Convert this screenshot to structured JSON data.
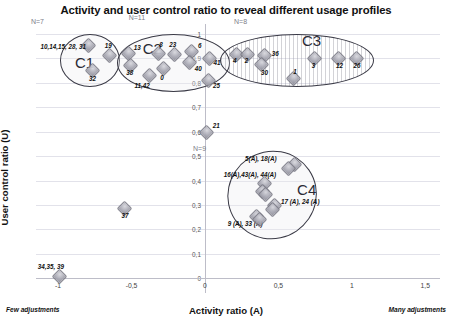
{
  "chart_data": {
    "type": "scatter",
    "title": "Activity and user control ratio to reveal different usage profiles",
    "xlabel": "Activity ratio (A)",
    "ylabel": "User control ratio (U)",
    "xlim": [
      -1.15,
      1.6
    ],
    "ylim": [
      -0.06,
      1.04
    ],
    "grid": true,
    "legend": "none",
    "xticks": [
      "-1",
      "-0,5",
      "0",
      "0,5",
      "1",
      "1,5"
    ],
    "xtick_values": [
      -1,
      -0.5,
      0,
      0.5,
      1,
      1.5
    ],
    "yticks": [
      "0",
      "0,1",
      "0,2",
      "0,3",
      "0,4",
      "0,5",
      "0,6",
      "0,7",
      "0,8",
      "0,9",
      "1"
    ],
    "ytick_values": [
      0,
      0.1,
      0.2,
      0.3,
      0.4,
      0.5,
      0.6,
      0.7,
      0.8,
      0.9,
      1.0
    ],
    "axis_notes": {
      "x_low": "Few adjustments",
      "x_high": "Many adjustments"
    },
    "clusters": [
      {
        "name": "C1",
        "count_label": "N=7",
        "style": "plain",
        "cx": -0.79,
        "cy": 0.895,
        "rx": 0.2,
        "ry": 0.105
      },
      {
        "name": "C2",
        "count_label": "N=11",
        "style": "plain",
        "cx": -0.22,
        "cy": 0.885,
        "rx": 0.38,
        "ry": 0.115
      },
      {
        "name": "C3",
        "count_label": "N=8",
        "style": "hatched",
        "cx": 0.62,
        "cy": 0.895,
        "rx": 0.52,
        "ry": 0.105
      },
      {
        "name": "C4",
        "count_label": "N=9",
        "style": "plain",
        "cx": 0.45,
        "cy": 0.345,
        "rx": 0.3,
        "ry": 0.175
      }
    ],
    "points": [
      {
        "label": "10,14,15, 28, 31",
        "x": -0.8,
        "y": 0.955,
        "lx": -47,
        "ly": -2,
        "cluster": "C1"
      },
      {
        "label": "19",
        "x": -0.655,
        "y": 0.915,
        "lx": -4,
        "ly": -13,
        "cluster": "C1"
      },
      {
        "label": "32",
        "x": -0.775,
        "y": 0.855,
        "lx": -2,
        "ly": 6,
        "cluster": "C1"
      },
      {
        "label": "13",
        "x": -0.525,
        "y": 0.925,
        "lx": 6,
        "ly": -8,
        "cluster": "C2"
      },
      {
        "label": "8",
        "x": -0.325,
        "y": 0.925,
        "lx": 2,
        "ly": -11,
        "cluster": "C2"
      },
      {
        "label": "23",
        "x": -0.215,
        "y": 0.92,
        "lx": -4,
        "ly": -12,
        "cluster": "C2"
      },
      {
        "label": "6",
        "x": -0.095,
        "y": 0.93,
        "lx": 7,
        "ly": -9,
        "cluster": "C2"
      },
      {
        "label": "41",
        "x": 0.025,
        "y": 0.905,
        "lx": 5,
        "ly": 2,
        "cluster": "C2"
      },
      {
        "label": "38",
        "x": -0.515,
        "y": 0.875,
        "lx": -3,
        "ly": 5,
        "cluster": "C2"
      },
      {
        "label": "40",
        "x": -0.11,
        "y": 0.885,
        "lx": 6,
        "ly": 3,
        "cluster": "C2"
      },
      {
        "label": "0",
        "x": -0.29,
        "y": 0.862,
        "lx": -2,
        "ly": 6,
        "cluster": "C2"
      },
      {
        "label": "11,42",
        "x": -0.385,
        "y": 0.832,
        "lx": -14,
        "ly": 7,
        "cluster": "C2"
      },
      {
        "label": "25",
        "x": 0.02,
        "y": 0.815,
        "lx": 5,
        "ly": 3,
        "cluster": "C2"
      },
      {
        "label": "4",
        "x": 0.205,
        "y": 0.92,
        "lx": -2,
        "ly": 4,
        "cluster": "C3"
      },
      {
        "label": "2",
        "x": 0.285,
        "y": 0.92,
        "lx": -2,
        "ly": 4,
        "cluster": "C3"
      },
      {
        "label": "36",
        "x": 0.4,
        "y": 0.915,
        "lx": 8,
        "ly": -5,
        "cluster": "C3"
      },
      {
        "label": "30",
        "x": 0.375,
        "y": 0.878,
        "lx": 1,
        "ly": 5,
        "cluster": "C3"
      },
      {
        "label": "3",
        "x": 0.74,
        "y": 0.905,
        "lx": -2,
        "ly": 5,
        "cluster": "C3"
      },
      {
        "label": "12",
        "x": 0.905,
        "y": 0.905,
        "lx": -2,
        "ly": 5,
        "cluster": "C3"
      },
      {
        "label": "26",
        "x": 1.025,
        "y": 0.905,
        "lx": -2,
        "ly": 5,
        "cluster": "C3"
      },
      {
        "label": "1",
        "x": 0.595,
        "y": 0.822,
        "lx": 1,
        "ly": -9,
        "cluster": "C3"
      },
      {
        "label": "21",
        "x": 0.005,
        "y": 0.6,
        "lx": 7,
        "ly": -10,
        "cluster": ""
      },
      {
        "label": "5(A), 18(A)",
        "x": 0.6,
        "y": 0.468,
        "lx": -48,
        "ly": -9,
        "cluster": "C4"
      },
      {
        "label": "",
        "x": 0.565,
        "y": 0.452,
        "lx": 0,
        "ly": 0,
        "cluster": "C4"
      },
      {
        "label": "16(A),43(A), 44(A)",
        "x": 0.4,
        "y": 0.39,
        "lx": -40,
        "ly": -12,
        "cluster": "C4"
      },
      {
        "label": "",
        "x": 0.385,
        "y": 0.36,
        "lx": 0,
        "ly": 0,
        "cluster": "C4"
      },
      {
        "label": "",
        "x": 0.405,
        "y": 0.345,
        "lx": 0,
        "ly": 0,
        "cluster": "C4"
      },
      {
        "label": "17 (A), 24 (A)",
        "x": 0.47,
        "y": 0.302,
        "lx": 7,
        "ly": -6,
        "cluster": "C4"
      },
      {
        "label": "",
        "x": 0.45,
        "y": 0.285,
        "lx": 0,
        "ly": 0,
        "cluster": "C4"
      },
      {
        "label": "9 (A), 33 (A)",
        "x": 0.345,
        "y": 0.258,
        "lx": -28,
        "ly": 5,
        "cluster": "C4"
      },
      {
        "label": "",
        "x": 0.365,
        "y": 0.243,
        "lx": 0,
        "ly": 0,
        "cluster": "C4"
      },
      {
        "label": "37",
        "x": -0.555,
        "y": 0.29,
        "lx": -2,
        "ly": 5,
        "cluster": ""
      },
      {
        "label": "34,35, 39",
        "x": -0.995,
        "y": 0.012,
        "lx": -21,
        "ly": -12,
        "cluster": ""
      }
    ]
  }
}
